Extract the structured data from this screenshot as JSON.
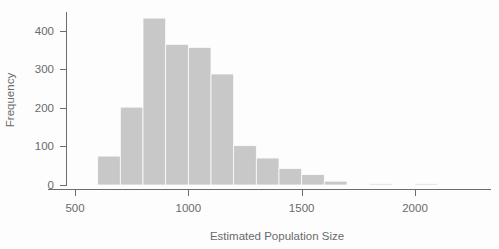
{
  "chart_data": {
    "type": "bar",
    "title": "",
    "subtitle": "",
    "xlabel": "Estimated Population Size",
    "ylabel": "Frequency",
    "grid": false,
    "legend": null,
    "legend_position": "none",
    "bin_width": 100,
    "xlim": [
      500,
      2150
    ],
    "ylim": [
      0,
      450
    ],
    "x_ticks": [
      500,
      1000,
      1500,
      2000
    ],
    "x_tick_labels": [
      "500",
      "1000",
      "1500",
      "2000"
    ],
    "y_ticks": [
      0,
      100,
      200,
      300,
      400
    ],
    "y_tick_labels": [
      "0",
      "100",
      "200",
      "300",
      "400"
    ],
    "bar_color": "#c8c8c8",
    "axis_color": "#6d6d6d",
    "text_color": "#6a6a6a",
    "background_color": "#fdfdfd",
    "bins": [
      {
        "x0": 600,
        "x1": 700,
        "value": 75
      },
      {
        "x0": 700,
        "x1": 800,
        "value": 202
      },
      {
        "x0": 800,
        "x1": 900,
        "value": 433
      },
      {
        "x0": 900,
        "x1": 1000,
        "value": 365
      },
      {
        "x0": 1000,
        "x1": 1100,
        "value": 357
      },
      {
        "x0": 1100,
        "x1": 1200,
        "value": 288
      },
      {
        "x0": 1200,
        "x1": 1300,
        "value": 102
      },
      {
        "x0": 1300,
        "x1": 1400,
        "value": 70
      },
      {
        "x0": 1400,
        "x1": 1500,
        "value": 43
      },
      {
        "x0": 1500,
        "x1": 1600,
        "value": 27
      },
      {
        "x0": 1600,
        "x1": 1700,
        "value": 10
      },
      {
        "x0": 1800,
        "x1": 1900,
        "value": 3
      },
      {
        "x0": 2000,
        "x1": 2100,
        "value": 2
      }
    ],
    "categories": [
      "600-700",
      "700-800",
      "800-900",
      "900-1000",
      "1000-1100",
      "1100-1200",
      "1200-1300",
      "1300-1400",
      "1400-1500",
      "1500-1600",
      "1600-1700",
      "1800-1900",
      "2000-2100"
    ],
    "values": [
      75,
      202,
      433,
      365,
      357,
      288,
      102,
      70,
      43,
      27,
      10,
      3,
      2
    ]
  },
  "axes": {
    "x_title": "Estimated Population Size",
    "y_title": "Frequency"
  }
}
